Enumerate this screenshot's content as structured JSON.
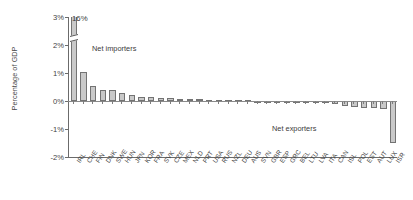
{
  "axis": {
    "ylabel": "Percentage of GDP",
    "yticks": [
      "3%",
      "2%",
      "1%",
      "0%",
      "-1%",
      "-2%"
    ],
    "ytick_values": [
      3,
      2,
      1,
      0,
      -1,
      -2
    ]
  },
  "annotations": {
    "peak_value_label": "16%",
    "net_importers": "Net importers",
    "net_exporters": "Net exporters"
  },
  "colors": {
    "bar_fill": "#c9c9c9",
    "bar_edge": "#737373",
    "axis": "#6b6b6b",
    "text": "#3a3a3a"
  },
  "chart_data": {
    "type": "bar",
    "title": "",
    "xlabel": "",
    "ylabel": "Percentage of GDP",
    "ylim": [
      -2,
      3
    ],
    "ytick_labels": [
      "3%",
      "2%",
      "1%",
      "0%",
      "-1%",
      "-2%"
    ],
    "grid": false,
    "legend": null,
    "categories": [
      "IRL",
      "CHE",
      "FIN",
      "DNK",
      "SWE",
      "HUN",
      "JPN",
      "KOR",
      "FRA",
      "SVK",
      "CZE",
      "MEX",
      "NLD",
      "PRT",
      "USA",
      "RUS",
      "NZL",
      "DEU",
      "AUS",
      "SVN",
      "GBR",
      "ESP",
      "GRC",
      "BEL",
      "LTU",
      "LVA",
      "ITA",
      "CAN",
      "ISL",
      "POL",
      "EST",
      "AUT",
      "LUX",
      "ISR"
    ],
    "values": [
      16.0,
      1.05,
      0.52,
      0.4,
      0.38,
      0.27,
      0.2,
      0.16,
      0.13,
      0.11,
      0.09,
      0.08,
      0.07,
      0.06,
      0.05,
      0.04,
      0.03,
      0.02,
      0.02,
      0.01,
      -0.01,
      -0.02,
      -0.03,
      -0.04,
      -0.05,
      -0.06,
      -0.08,
      -0.1,
      -0.18,
      -0.22,
      -0.24,
      -0.26,
      -0.3,
      -1.5
    ],
    "display_values": [
      3.0,
      1.05,
      0.52,
      0.4,
      0.38,
      0.27,
      0.2,
      0.16,
      0.13,
      0.11,
      0.09,
      0.08,
      0.07,
      0.06,
      0.05,
      0.04,
      0.03,
      0.02,
      0.02,
      0.01,
      -0.01,
      -0.02,
      -0.03,
      -0.04,
      -0.05,
      -0.06,
      -0.08,
      -0.1,
      -0.18,
      -0.22,
      -0.24,
      -0.26,
      -0.3,
      -1.5
    ]
  }
}
